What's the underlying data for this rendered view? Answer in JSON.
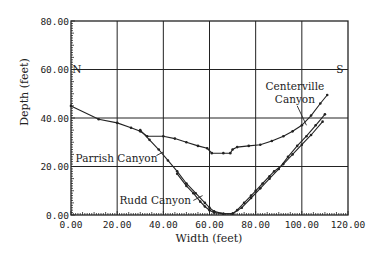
{
  "chart_data": {
    "type": "line",
    "title": "",
    "xlabel": "Width (feet)",
    "ylabel": "Depth (feet)",
    "xlim": [
      0,
      120
    ],
    "ylim": [
      0,
      80
    ],
    "x_ticks": [
      "0.00",
      "20.00",
      "40.00",
      "60.00",
      "80.00",
      "100.00",
      "120.00"
    ],
    "y_ticks": [
      "0.00",
      "20.00",
      "40.00",
      "60.00",
      "80.00"
    ],
    "grid": true,
    "annotations": [
      {
        "text": "N",
        "x": 0.5,
        "y": 60
      },
      {
        "text": "S",
        "x": 118,
        "y": 60
      },
      {
        "text": "Centerville",
        "x": 97,
        "y": 53
      },
      {
        "text": "Canyon",
        "x": 97,
        "y": 47.5
      },
      {
        "text": "Parrish Canyon",
        "x": 2,
        "y": 23.5
      },
      {
        "text": "Rudd Canyon",
        "x": 21,
        "y": 6
      }
    ],
    "series": [
      {
        "name": "Centerville Canyon",
        "x": [
          0,
          12,
          20,
          26,
          30,
          33,
          40,
          45,
          50,
          55,
          59,
          61,
          66,
          69,
          70,
          72,
          77,
          82,
          87,
          92,
          96,
          100,
          104,
          108,
          111
        ],
        "y": [
          45,
          39.5,
          38,
          36,
          34.5,
          32.5,
          32.5,
          31.5,
          30,
          28.5,
          27.5,
          25.5,
          25.5,
          25.5,
          27,
          28,
          28.5,
          29,
          30.5,
          32.5,
          34.5,
          37,
          41,
          46,
          49.5
        ]
      },
      {
        "name": "Parrish Canyon",
        "x": [
          30,
          34,
          38,
          42,
          46,
          50,
          54,
          58,
          60,
          62,
          66,
          70,
          74,
          78,
          82,
          86,
          90,
          94,
          98,
          102,
          106,
          110
        ],
        "y": [
          35,
          31,
          27,
          22.5,
          18,
          13,
          9,
          5,
          3,
          1.5,
          0.5,
          0.5,
          3,
          7,
          11,
          15,
          19,
          24,
          28.5,
          32.5,
          37,
          41.5
        ]
      },
      {
        "name": "Rudd Canyon",
        "x": [
          46,
          50,
          53,
          56,
          58,
          60,
          62,
          66,
          70,
          72,
          75,
          78,
          80,
          83,
          86,
          88,
          92,
          96,
          100,
          104,
          109
        ],
        "y": [
          17,
          12,
          9,
          5.5,
          3.5,
          2,
          1,
          0.5,
          0.5,
          2,
          5,
          8,
          10,
          13,
          16,
          18,
          21,
          25,
          29,
          33,
          38.5
        ]
      }
    ]
  }
}
